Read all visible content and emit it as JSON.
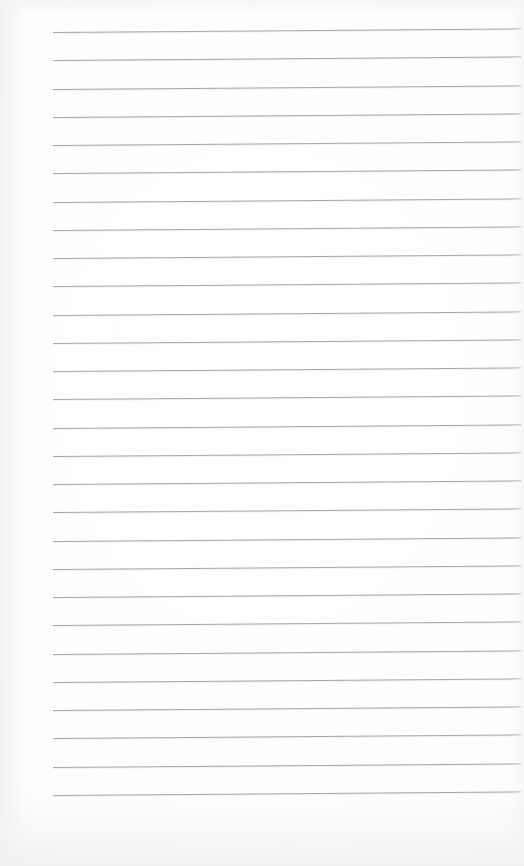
{
  "document": {
    "kind": "ruled-notepad-page",
    "title": "Blank lined notepad page",
    "page_width": 524,
    "page_height": 866,
    "background_color": "#fdfdfd",
    "content_text": "",
    "has_handwriting": false,
    "has_printed_text": false
  },
  "ruling": {
    "line_color": "#9b9ba0",
    "line_thickness_px": 1,
    "line_count": 28,
    "first_line_y": 32,
    "line_pitch_px": 28.25,
    "left_margin_x": 53,
    "right_end_x": 521,
    "tilt_degrees": -0.45,
    "style": "single-ruled-horizontal"
  },
  "lines": [
    {
      "index": 1,
      "y": 32.0
    },
    {
      "index": 2,
      "y": 60.3
    },
    {
      "index": 3,
      "y": 88.5
    },
    {
      "index": 4,
      "y": 116.8
    },
    {
      "index": 5,
      "y": 145.0
    },
    {
      "index": 6,
      "y": 173.3
    },
    {
      "index": 7,
      "y": 201.5
    },
    {
      "index": 8,
      "y": 229.8
    },
    {
      "index": 9,
      "y": 258.0
    },
    {
      "index": 10,
      "y": 286.3
    },
    {
      "index": 11,
      "y": 314.5
    },
    {
      "index": 12,
      "y": 342.8
    },
    {
      "index": 13,
      "y": 371.0
    },
    {
      "index": 14,
      "y": 399.3
    },
    {
      "index": 15,
      "y": 427.5
    },
    {
      "index": 16,
      "y": 455.8
    },
    {
      "index": 17,
      "y": 484.0
    },
    {
      "index": 18,
      "y": 512.3
    },
    {
      "index": 19,
      "y": 540.5
    },
    {
      "index": 20,
      "y": 568.8
    },
    {
      "index": 21,
      "y": 597.0
    },
    {
      "index": 22,
      "y": 625.3
    },
    {
      "index": 23,
      "y": 653.5
    },
    {
      "index": 24,
      "y": 681.8
    },
    {
      "index": 25,
      "y": 710.0
    },
    {
      "index": 26,
      "y": 738.3
    },
    {
      "index": 27,
      "y": 766.5
    },
    {
      "index": 28,
      "y": 794.8
    }
  ]
}
